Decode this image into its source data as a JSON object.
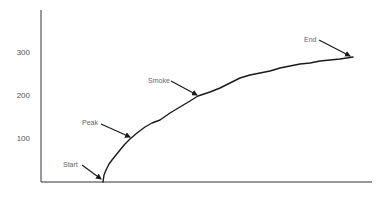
{
  "chart_data": {
    "type": "line",
    "title": "",
    "xlabel": "",
    "ylabel": "",
    "ylim": [
      0,
      400
    ],
    "grid": false,
    "legend": null,
    "y_ticks": [
      100,
      200,
      300
    ],
    "y_tick_labels": [
      "100",
      "200",
      "300"
    ],
    "x_ticks": [],
    "series": [
      {
        "name": "curve",
        "x": [
          0,
          1,
          3,
          6,
          9,
          12,
          16,
          21,
          27,
          32,
          38,
          44,
          50,
          56,
          60,
          68,
          74,
          80,
          86,
          94
        ],
        "y": [
          0,
          28,
          51,
          74,
          94,
          100,
          128,
          144,
          174,
          200,
          219,
          242,
          253,
          267,
          258,
          270,
          277,
          284,
          291,
          298
        ]
      }
    ],
    "annotations": [
      {
        "text": "Start",
        "x": 0,
        "y": 0
      },
      {
        "text": "Peak",
        "x": 9,
        "y": 100
      },
      {
        "text": "Smoke",
        "x": 32,
        "y": 200
      },
      {
        "text": "End",
        "x": 94,
        "y": 290
      }
    ]
  },
  "render": {
    "axis_color": "#333333",
    "line_color": "#1a1a1a",
    "plot": {
      "x0": 41,
      "x1": 372,
      "y0": 182,
      "ytop": 10,
      "px_per_unit_y": 0.43
    },
    "curve_px": [
      [
        103,
        182
      ],
      [
        104,
        175
      ],
      [
        106,
        170
      ],
      [
        109,
        164
      ],
      [
        112,
        160
      ],
      [
        116,
        155
      ],
      [
        120,
        150
      ],
      [
        125,
        144
      ],
      [
        130,
        139
      ],
      [
        137,
        133
      ],
      [
        145,
        127
      ],
      [
        152,
        123
      ],
      [
        160,
        120
      ],
      [
        170,
        113
      ],
      [
        180,
        107
      ],
      [
        190,
        101
      ],
      [
        198,
        96
      ],
      [
        210,
        92
      ],
      [
        220,
        88
      ],
      [
        230,
        83
      ],
      [
        240,
        78
      ],
      [
        250,
        75
      ],
      [
        260,
        73
      ],
      [
        270,
        71
      ],
      [
        280,
        68
      ],
      [
        290,
        66
      ],
      [
        300,
        64
      ],
      [
        310,
        63
      ],
      [
        320,
        61
      ],
      [
        330,
        60
      ],
      [
        340,
        59
      ],
      [
        353,
        57
      ]
    ],
    "annotations_px": [
      {
        "key": "start",
        "label_x": 63,
        "label_y": 167,
        "ax0": 82,
        "ay0": 165,
        "ax1": 101,
        "ay1": 179
      },
      {
        "key": "peak",
        "label_x": 82,
        "label_y": 125,
        "ax0": 101,
        "ay0": 124,
        "ax1": 130,
        "ay1": 137
      },
      {
        "key": "smoke",
        "label_x": 148,
        "label_y": 83,
        "ax0": 171,
        "ay0": 81,
        "ax1": 197,
        "ay1": 95
      },
      {
        "key": "end",
        "label_x": 304,
        "label_y": 42,
        "ax0": 319,
        "ay0": 40,
        "ax1": 350,
        "ay1": 56
      }
    ],
    "ytick_px": [
      {
        "label_index": 0,
        "y": 141
      },
      {
        "label_index": 1,
        "y": 98
      },
      {
        "label_index": 2,
        "y": 55
      }
    ]
  }
}
